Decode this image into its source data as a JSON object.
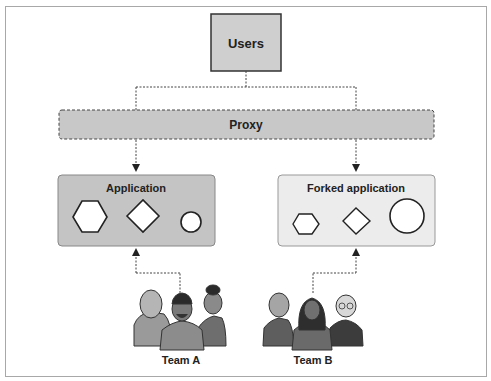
{
  "diagram": {
    "users": {
      "label": "Users"
    },
    "proxy": {
      "label": "Proxy"
    },
    "application": {
      "label": "Application",
      "shapes": [
        "hexagon",
        "diamond",
        "small-circle"
      ]
    },
    "forked_application": {
      "label": "Forked application",
      "shapes": [
        "small-hexagon",
        "diamond",
        "large-circle"
      ]
    },
    "team_a": {
      "label": "Team A"
    },
    "team_b": {
      "label": "Team B"
    }
  },
  "colors": {
    "users_fill": "#cfcfcf",
    "proxy_fill": "#c8c8c8",
    "application_fill": "#c4c4c4",
    "forked_fill": "#ececec",
    "stroke": "#333333"
  }
}
